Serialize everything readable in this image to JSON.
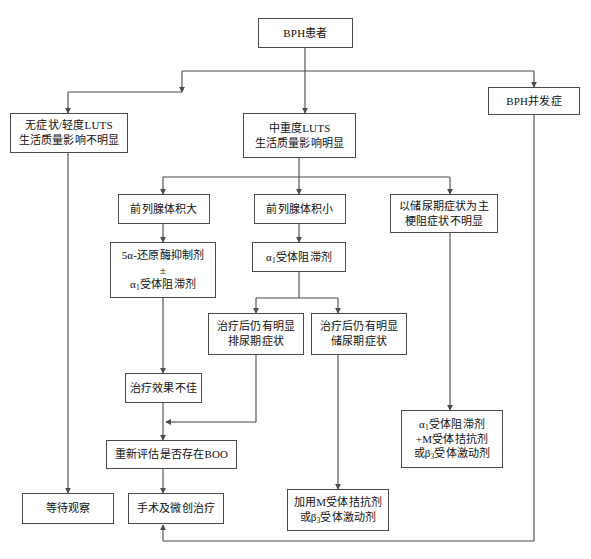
{
  "diagram": {
    "stroke_color": "#4a4a4a",
    "text_color": "#111111",
    "background_color": "#ffffff"
  },
  "nodes": {
    "bph_patient": {
      "lines": [
        "BPH患者"
      ]
    },
    "bph_complication": {
      "lines": [
        "BPH并发症"
      ]
    },
    "mild_luts": {
      "lines": [
        "无症状/轻度LUTS",
        "生活质量影响不明显"
      ]
    },
    "moderate_severe_luts": {
      "lines": [
        "中重度LUTS",
        "生活质量影响明显"
      ]
    },
    "prostate_large": {
      "lines": [
        "前列腺体积大"
      ]
    },
    "prostate_small": {
      "lines": [
        "前列腺体积小"
      ]
    },
    "storage_dominant": {
      "lines": [
        "以储尿期症状为主",
        "梗阻症状不明显"
      ]
    },
    "five_ar_inhibitor": {
      "lines": [
        "5α-还原酶抑制剂",
        "±",
        "α<sub>1</sub>受体阻滞剂"
      ]
    },
    "alpha1_blocker": {
      "lines": [
        "α<sub>1</sub>受体阻滞剂"
      ]
    },
    "persist_voiding": {
      "lines": [
        "治疗后仍有明显",
        "排尿期症状"
      ]
    },
    "persist_storage": {
      "lines": [
        "治疗后仍有明显",
        "储尿期症状"
      ]
    },
    "poor_response": {
      "lines": [
        "治疗效果不佳"
      ]
    },
    "reassess_boo": {
      "lines": [
        "重新评估是否存在BOO"
      ]
    },
    "watchful_waiting": {
      "lines": [
        "等待观察"
      ]
    },
    "surgery_minimally_invasive": {
      "lines": [
        "手术及微创治疗"
      ]
    },
    "add_m_antagonist": {
      "lines": [
        "加用M受体拮抗剂",
        "或β<sub>3</sub>受体激动剂"
      ]
    },
    "alpha1_plus_m": {
      "lines": [
        "α<sub>1</sub>受体阻滞剂",
        "+M受体拮抗剂",
        "或β<sub>3</sub>受体激动剂"
      ]
    }
  }
}
